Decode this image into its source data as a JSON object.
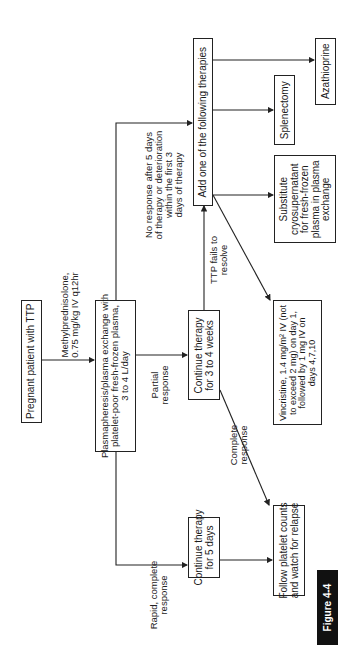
{
  "figure_label": "Figure 4-4",
  "orientation": "rotated 90° counterclockwise",
  "nodes": {
    "start": "Pregnant patient with TTP",
    "plasmapheresis": "Plasmapheresis/plasma exchange with\nplatelet-poor fresh-frozen plasma,\n3 to 4 L/day",
    "continue_5_days": "Continue therapy\nfor 5 days",
    "continue_3_4_weeks": "Continue therapy\nfor 3 to 4 weeks",
    "add_therapies": "Add one of the following therapies",
    "follow_platelets": "Follow platelet counts\nand watch for relapse",
    "vincristine": "Vincristine, 1.4 mg/m² IV (not\nto exceed 2 mg) on day 1,\nfollowed by 1 mg IV on\ndays 4,7,10",
    "cryosupernatant": "Substitute\ncryosupernatant\nfor fresh-frozen\nplasma in plasma\nexchange",
    "splenectomy": "Splenectomy",
    "azathioprine": "Azathioprine"
  },
  "edge_labels": {
    "methylpred": "Methylprednisolone,\n0.75 mg/kg IV q12hr",
    "no_response": "No response after 5 days\nof therapy or deterioration\nwithin the first 3\ndays of therapy",
    "partial": "Partial\nresponse",
    "rapid_complete": "Rapid, complete\nresponse",
    "ttp_fails": "TTP fails to\nresolve",
    "complete": "Complete\nresponse"
  },
  "colors": {
    "line": "#222222",
    "figure_bg": "#111111",
    "figure_text": "#ffffff"
  }
}
